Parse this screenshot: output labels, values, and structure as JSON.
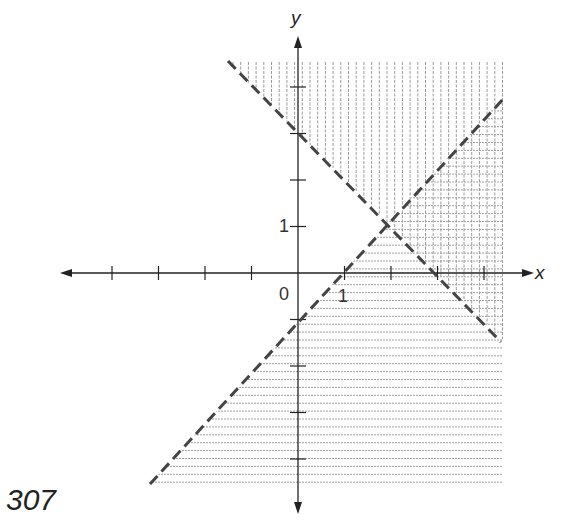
{
  "page_number": "307",
  "chart_data": {
    "type": "region-shading",
    "title": "",
    "xlabel": "x",
    "ylabel": "y",
    "x_tick_labels": [
      {
        "value": 0,
        "label": "0"
      },
      {
        "value": 1,
        "label": "1"
      }
    ],
    "y_tick_labels": [
      {
        "value": 1,
        "label": "1"
      }
    ],
    "x_ticks": [
      -4,
      -3,
      -2,
      -1,
      1,
      2,
      3,
      4
    ],
    "y_ticks": [
      -4,
      -3,
      -2,
      -1,
      1,
      2,
      3,
      4
    ],
    "xlim": [
      -5,
      5
    ],
    "ylim": [
      -5,
      5
    ],
    "lines": [
      {
        "equation": "y = x - 1",
        "style": "dashed",
        "from": [
          -3.2,
          -4.5
        ],
        "to": [
          4.5,
          3.7
        ],
        "shading": "horizontal",
        "shade_side": "below"
      },
      {
        "equation": "x + y = 3",
        "style": "dashed",
        "from": [
          -1.5,
          4.5
        ],
        "to": [
          4.4,
          -1.5
        ],
        "shading": "vertical",
        "shade_side": "above"
      }
    ],
    "intersection": [
      2,
      1
    ],
    "grid": false,
    "colors": {
      "axis": "#222222",
      "dashed": "#444444",
      "hatch": "#9a9a9a"
    }
  }
}
